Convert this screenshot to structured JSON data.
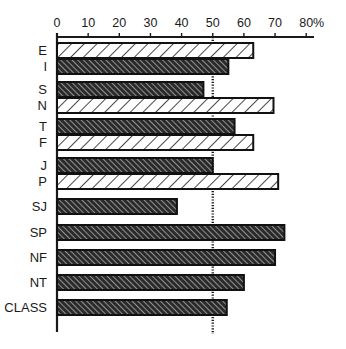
{
  "chart_data": {
    "type": "bar",
    "orientation": "horizontal",
    "title": "",
    "xlabel": "",
    "ylabel": "",
    "xlim": [
      0,
      80
    ],
    "x_ticks": [
      0,
      10,
      20,
      30,
      40,
      50,
      60,
      70,
      80
    ],
    "x_unit_label": "%",
    "reference_line": {
      "value": 50,
      "style": "dotted"
    },
    "grid": false,
    "legend": null,
    "categories": [
      "E",
      "I",
      "S",
      "N",
      "T",
      "F",
      "J",
      "P",
      "SJ",
      "SP",
      "NF",
      "NT",
      "CLASS"
    ],
    "values": [
      63,
      55,
      47,
      69.5,
      57,
      63,
      50,
      71,
      38.5,
      73,
      70,
      60,
      54.5
    ],
    "patterns": [
      "light",
      "dark",
      "dark",
      "light",
      "dark",
      "light",
      "dark",
      "light",
      "dark",
      "dark",
      "dark",
      "dark",
      "dark"
    ],
    "groups": [
      [
        "E",
        "I"
      ],
      [
        "S",
        "N"
      ],
      [
        "T",
        "F"
      ],
      [
        "J",
        "P"
      ],
      [
        "SJ"
      ],
      [
        "SP"
      ],
      [
        "NF"
      ],
      [
        "NT"
      ],
      [
        "CLASS"
      ]
    ]
  },
  "colors": {
    "axis": "#1a1a1a",
    "bar_outline": "#111111",
    "light_fill": "#ffffff",
    "dark_fill": "#2a2a2a",
    "hatch_light": "#1a1a1a",
    "hatch_dark": "#e8e8e8"
  }
}
